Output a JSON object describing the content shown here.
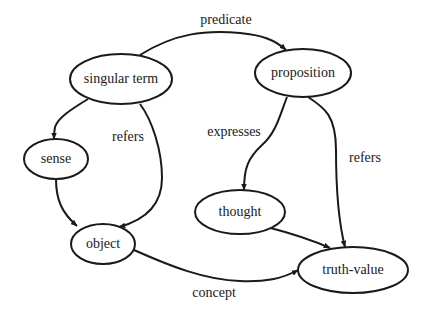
{
  "diagram": {
    "type": "directed-graph",
    "colors": {
      "stroke": "#1a1a1a",
      "background": "#ffffff",
      "node_fill": "#ffffff"
    },
    "nodes": [
      {
        "id": "singular_term",
        "label": "singular term",
        "cx": 121,
        "cy": 79,
        "rx": 51,
        "ry": 25
      },
      {
        "id": "proposition",
        "label": "proposition",
        "cx": 303,
        "cy": 73,
        "rx": 48,
        "ry": 24
      },
      {
        "id": "sense",
        "label": "sense",
        "cx": 56,
        "cy": 159,
        "rx": 32,
        "ry": 20
      },
      {
        "id": "object",
        "label": "object",
        "cx": 103,
        "cy": 244,
        "rx": 32,
        "ry": 20
      },
      {
        "id": "thought",
        "label": "thought",
        "cx": 240,
        "cy": 212,
        "rx": 45,
        "ry": 22
      },
      {
        "id": "truth_value",
        "label": "truth-value",
        "cx": 353,
        "cy": 270,
        "rx": 55,
        "ry": 23
      }
    ],
    "edges": [
      {
        "id": "predicate",
        "from": "singular_term",
        "to": "proposition",
        "label": "predicate",
        "label_x": 226,
        "label_y": 21
      },
      {
        "id": "st_sense",
        "from": "singular_term",
        "to": "sense",
        "label": ""
      },
      {
        "id": "refers_left",
        "from": "singular_term",
        "to": "object",
        "label": "refers",
        "label_x": 128,
        "label_y": 138
      },
      {
        "id": "sense_object",
        "from": "sense",
        "to": "object",
        "label": ""
      },
      {
        "id": "expresses",
        "from": "proposition",
        "to": "thought",
        "label": "expresses",
        "label_x": 234,
        "label_y": 133
      },
      {
        "id": "refers_right",
        "from": "proposition",
        "to": "truth_value",
        "label": "refers",
        "label_x": 365,
        "label_y": 159
      },
      {
        "id": "thought_tv",
        "from": "thought",
        "to": "truth_value",
        "label": ""
      },
      {
        "id": "concept",
        "from": "object",
        "to": "truth_value",
        "label": "concept",
        "label_x": 214,
        "label_y": 294
      }
    ]
  }
}
